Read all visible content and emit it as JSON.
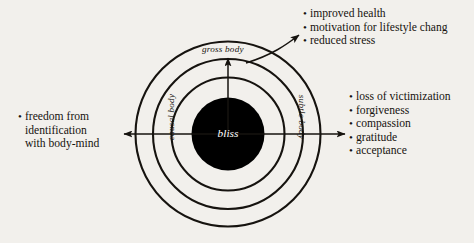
{
  "figure": {
    "background_color": "#f2f0ec",
    "ink_color": "#16130f",
    "center_fill_color": "#000000",
    "center_label_color": "#ffffff"
  },
  "diagram": {
    "center_label": "bliss",
    "ring_labels": {
      "outer": "gross body",
      "middle": "subtle body",
      "inner": "causal body"
    }
  },
  "lists": {
    "top_right": {
      "items": [
        "improved health",
        "motivation for lifestyle chang",
        "reduced stress"
      ]
    },
    "right": {
      "items": [
        "loss of victimization",
        "forgiveness",
        "compassion",
        "gratitude",
        "acceptance"
      ]
    },
    "left": {
      "items": [
        {
          "lines": [
            "freedom from",
            "identification",
            "with body-mind"
          ]
        }
      ]
    }
  },
  "bullet_glyph": "•"
}
